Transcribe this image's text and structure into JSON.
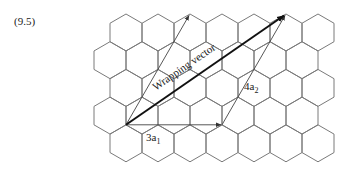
{
  "equation_number": "(9.5)",
  "diagram": {
    "type": "hexagonal-lattice",
    "grid": {
      "rows": 5,
      "hexes_per_row": 7,
      "orientation": "pointy-top",
      "line_color": "#7a7a7a"
    },
    "vectors": [
      {
        "name": "3a1",
        "label_main": "3a",
        "label_sub": "1"
      },
      {
        "name": "4a2",
        "label_main": "4a",
        "label_sub": "2"
      },
      {
        "name": "wrapping-vector",
        "label": "Wrapping vector"
      }
    ],
    "labels": {
      "a1_main": "3a",
      "a1_sub": "1",
      "a2_main": "4a",
      "a2_sub": "2",
      "wrapping": "Wrapping vector"
    }
  }
}
